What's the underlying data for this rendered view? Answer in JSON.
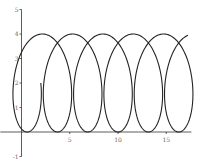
{
  "chart_data": {
    "type": "line",
    "title": "",
    "xlabel": "",
    "ylabel": "",
    "xlim": [
      -2.2,
      17.6
    ],
    "ylim": [
      -1,
      5
    ],
    "grid": false,
    "legend": null,
    "x_ticks": [
      5,
      10,
      15
    ],
    "x_tick_labels": [
      "5",
      "10",
      "15"
    ],
    "y_ticks": [
      -1,
      1,
      2,
      3,
      4,
      5
    ],
    "y_tick_labels": [
      "-1",
      "1",
      "2",
      "3",
      "4",
      "5"
    ],
    "series": [
      {
        "name": "parametric curve (looping trochoid)",
        "parametric": {
          "x": "0.5*t - 0.2 + 2.2*cos(t)",
          "y": "2 - 2*sin(t)",
          "t_range": [
            0,
            35.9
          ]
        },
        "key_points": {
          "start": [
            2.0,
            2.0
          ],
          "minima_x_at_y0": [
            0.6,
            3.7,
            6.8,
            9.9,
            13.0,
            16.0
          ],
          "maxima_x_at_y4": [
            2.2,
            5.3,
            8.4,
            11.6,
            14.7,
            17.6
          ]
        },
        "color": "#222222"
      }
    ]
  },
  "colors": {
    "curve": "#222222",
    "axis": "#333333",
    "label": "#666666"
  }
}
